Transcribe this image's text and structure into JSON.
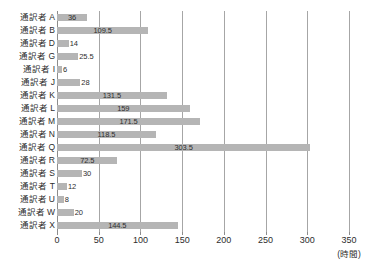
{
  "chart_data": {
    "type": "bar",
    "orientation": "horizontal",
    "title": "",
    "subtitle": "",
    "xlabel": "(時間)",
    "ylabel": "",
    "xlim": [
      0,
      350
    ],
    "grid": true,
    "legend": false,
    "legend_position": "none",
    "bar_color": "#b5b5b5",
    "axis_color": "#8c8c8c",
    "grid_color": "#a6a6a6",
    "xticks": [
      0,
      50,
      100,
      150,
      200,
      250,
      300,
      350
    ],
    "xtick_labels": [
      "0",
      "50",
      "100",
      "150",
      "200",
      "250",
      "300",
      "350"
    ],
    "categories": [
      "通訳者 A",
      "通訳者 B",
      "通訳者 D",
      "通訳者 G",
      "通訳者 I",
      "通訳者 J",
      "通訳者 K",
      "通訳者 L",
      "通訳者 M",
      "通訳者 N",
      "通訳者 Q",
      "通訳者 R",
      "通訳者 S",
      "通訳者 T",
      "通訳者 U",
      "通訳者 W",
      "通訳者 X"
    ],
    "values": [
      36,
      109.5,
      14,
      25.5,
      6,
      28,
      131.5,
      159,
      171.5,
      118.5,
      303.5,
      72.5,
      30,
      12,
      8,
      20,
      144.5
    ],
    "data_labels": [
      "36",
      "109.5",
      "14",
      "25.5",
      "6",
      "28",
      "131.5",
      "159",
      "171.5",
      "118.5",
      "303.5",
      "72.5",
      "30",
      "12",
      "8",
      "20",
      "144.5"
    ]
  }
}
